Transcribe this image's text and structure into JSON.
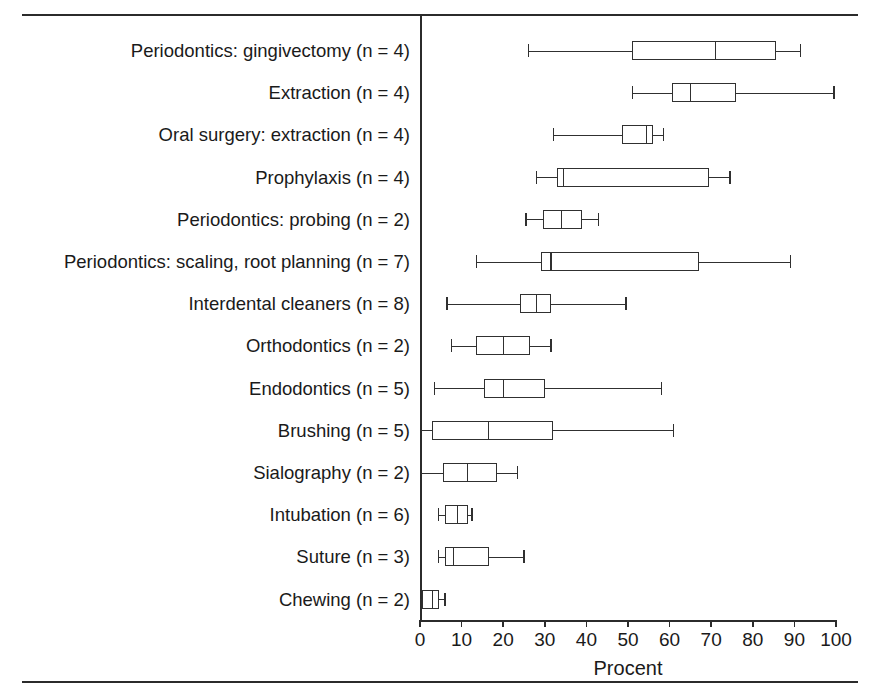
{
  "figure": {
    "has_top_rule": true,
    "has_bottom_rule": true,
    "background_color": "#ffffff",
    "line_color": "#303030"
  },
  "axis": {
    "x_title": "Procent",
    "ticks": [
      0,
      10,
      20,
      30,
      40,
      50,
      60,
      70,
      80,
      90,
      100
    ],
    "tick_labels": [
      "0",
      "10",
      "20",
      "30",
      "40",
      "50",
      "60",
      "70",
      "80",
      "90",
      "100"
    ]
  },
  "chart_data": {
    "type": "box",
    "title": "",
    "xlabel": "Procent",
    "ylabel": "",
    "xlim": [
      0,
      100
    ],
    "grid": false,
    "legend": "none",
    "orientation": "horizontal",
    "categories": [
      "Periodontics: gingivectomy (n = 4)",
      "Extraction (n = 4)",
      "Oral surgery: extraction (n = 4)",
      "Prophylaxis (n = 4)",
      "Periodontics: probing (n = 2)",
      "Periodontics: scaling, root planning (n = 7)",
      "Interdental cleaners (n = 8)",
      "Orthodontics (n = 2)",
      "Endodontics (n = 5)",
      "Brushing (n = 5)",
      "Sialography (n = 2)",
      "Intubation (n = 6)",
      "Suture (n = 3)",
      "Chewing (n = 2)"
    ],
    "boxes": [
      {
        "label": "Periodontics: gingivectomy (n = 4)",
        "n": 4,
        "whisker_low": 26,
        "q1": 51,
        "median": 71,
        "q3": 85.5,
        "whisker_high": 91.5
      },
      {
        "label": "Extraction (n = 4)",
        "n": 4,
        "whisker_low": 51,
        "q1": 60.5,
        "median": 65,
        "q3": 76,
        "whisker_high": 99.5
      },
      {
        "label": "Oral surgery: extraction (n = 4)",
        "n": 4,
        "whisker_low": 32,
        "q1": 48.5,
        "median": 54.5,
        "q3": 56,
        "whisker_high": 58.5
      },
      {
        "label": "Prophylaxis (n = 4)",
        "n": 4,
        "whisker_low": 28,
        "q1": 33,
        "median": 34.5,
        "q3": 69.5,
        "whisker_high": 74.5
      },
      {
        "label": "Periodontics: probing (n = 2)",
        "n": 2,
        "whisker_low": 25.5,
        "q1": 29.5,
        "median": 34,
        "q3": 39,
        "whisker_high": 43
      },
      {
        "label": "Periodontics: scaling, root planning (n = 7)",
        "n": 7,
        "whisker_low": 13.5,
        "q1": 29,
        "median": 31.5,
        "q3": 67,
        "whisker_high": 89
      },
      {
        "label": "Interdental cleaners (n = 8)",
        "n": 8,
        "whisker_low": 6.5,
        "q1": 24,
        "median": 28,
        "q3": 31.5,
        "whisker_high": 49.5
      },
      {
        "label": "Orthodontics (n = 2)",
        "n": 2,
        "whisker_low": 7.5,
        "q1": 13.5,
        "median": 20,
        "q3": 26.5,
        "whisker_high": 31.5
      },
      {
        "label": "Endodontics (n = 5)",
        "n": 5,
        "whisker_low": 3.5,
        "q1": 15.5,
        "median": 20,
        "q3": 30,
        "whisker_high": 58
      },
      {
        "label": "Brushing (n = 5)",
        "n": 5,
        "whisker_low": 0,
        "q1": 3,
        "median": 16.5,
        "q3": 32,
        "whisker_high": 61
      },
      {
        "label": "Sialography (n = 2)",
        "n": 2,
        "whisker_low": 0,
        "q1": 5.5,
        "median": 11.5,
        "q3": 18.5,
        "whisker_high": 23.5
      },
      {
        "label": "Intubation (n = 6)",
        "n": 6,
        "whisker_low": 4.5,
        "q1": 6,
        "median": 9,
        "q3": 11.5,
        "whisker_high": 12.5
      },
      {
        "label": "Suture (n = 3)",
        "n": 3,
        "whisker_low": 4.5,
        "q1": 6,
        "median": 8,
        "q3": 16.5,
        "whisker_high": 25
      },
      {
        "label": "Chewing (n = 2)",
        "n": 2,
        "whisker_low": 0,
        "q1": 0.5,
        "median": 3,
        "q3": 4.5,
        "whisker_high": 6
      }
    ]
  }
}
